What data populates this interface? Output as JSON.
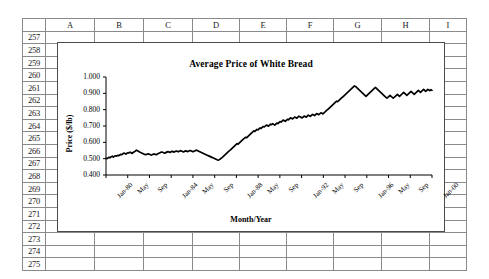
{
  "spreadsheet": {
    "columns": [
      "A",
      "B",
      "C",
      "D",
      "E",
      "F",
      "G",
      "H",
      "I"
    ],
    "rows": [
      "257",
      "258",
      "259",
      "260",
      "261",
      "262",
      "263",
      "264",
      "265",
      "266",
      "267",
      "268",
      "269",
      "270",
      "271",
      "272",
      "273",
      "274",
      "275"
    ],
    "cells": []
  },
  "chart_data": {
    "type": "line",
    "title": "Average Price of White Bread",
    "xlabel": "Month/Year",
    "ylabel": "Price ($/lb)",
    "ylim": [
      0.4,
      1.0
    ],
    "yticks": [
      "0.400",
      "0.500",
      "0.600",
      "0.700",
      "0.800",
      "0.900",
      "1.000"
    ],
    "ytick_values": [
      0.4,
      0.5,
      0.6,
      0.7,
      0.8,
      0.9,
      1.0
    ],
    "xticks": [
      "Jan-80",
      "May",
      "Sep",
      "Jan-84",
      "May",
      "Sep",
      "Jan-88",
      "May",
      "Sep",
      "Jan-92",
      "May",
      "Sep",
      "Jan-96",
      "May",
      "Sep",
      "Jan-00"
    ],
    "grid": false,
    "legend": "none",
    "series_color": "#000000",
    "series": [
      {
        "name": "Average Price of White Bread",
        "values": [
          0.502,
          0.5,
          0.505,
          0.508,
          0.506,
          0.512,
          0.515,
          0.51,
          0.514,
          0.518,
          0.516,
          0.52,
          0.518,
          0.522,
          0.526,
          0.524,
          0.53,
          0.534,
          0.531,
          0.528,
          0.533,
          0.537,
          0.535,
          0.54,
          0.536,
          0.532,
          0.538,
          0.542,
          0.546,
          0.552,
          0.549,
          0.545,
          0.541,
          0.538,
          0.535,
          0.532,
          0.529,
          0.526,
          0.524,
          0.527,
          0.53,
          0.528,
          0.525,
          0.522,
          0.524,
          0.527,
          0.529,
          0.526,
          0.524,
          0.528,
          0.532,
          0.535,
          0.538,
          0.541,
          0.539,
          0.536,
          0.534,
          0.537,
          0.54,
          0.543,
          0.541,
          0.538,
          0.542,
          0.545,
          0.543,
          0.54,
          0.544,
          0.547,
          0.545,
          0.542,
          0.546,
          0.549,
          0.547,
          0.544,
          0.541,
          0.545,
          0.548,
          0.546,
          0.543,
          0.547,
          0.55,
          0.548,
          0.545,
          0.542,
          0.546,
          0.549,
          0.552,
          0.55,
          0.547,
          0.544,
          0.541,
          0.538,
          0.535,
          0.532,
          0.529,
          0.526,
          0.523,
          0.52,
          0.517,
          0.514,
          0.511,
          0.508,
          0.505,
          0.502,
          0.499,
          0.496,
          0.493,
          0.491,
          0.494,
          0.498,
          0.503,
          0.508,
          0.514,
          0.52,
          0.526,
          0.532,
          0.538,
          0.544,
          0.55,
          0.556,
          0.562,
          0.568,
          0.574,
          0.58,
          0.586,
          0.592,
          0.589,
          0.595,
          0.601,
          0.607,
          0.613,
          0.619,
          0.625,
          0.631,
          0.628,
          0.634,
          0.64,
          0.646,
          0.652,
          0.658,
          0.664,
          0.67,
          0.667,
          0.673,
          0.679,
          0.676,
          0.682,
          0.688,
          0.685,
          0.691,
          0.697,
          0.694,
          0.7,
          0.706,
          0.703,
          0.699,
          0.705,
          0.711,
          0.708,
          0.714,
          0.71,
          0.706,
          0.712,
          0.718,
          0.715,
          0.721,
          0.727,
          0.724,
          0.73,
          0.736,
          0.733,
          0.729,
          0.735,
          0.741,
          0.738,
          0.744,
          0.75,
          0.747,
          0.743,
          0.749,
          0.755,
          0.752,
          0.748,
          0.754,
          0.76,
          0.757,
          0.753,
          0.749,
          0.755,
          0.761,
          0.758,
          0.754,
          0.76,
          0.766,
          0.763,
          0.759,
          0.765,
          0.771,
          0.768,
          0.764,
          0.77,
          0.776,
          0.773,
          0.769,
          0.775,
          0.781,
          0.778,
          0.774,
          0.78,
          0.786,
          0.792,
          0.798,
          0.804,
          0.81,
          0.816,
          0.822,
          0.828,
          0.834,
          0.84,
          0.846,
          0.852,
          0.849,
          0.855,
          0.861,
          0.867,
          0.873,
          0.879,
          0.885,
          0.891,
          0.897,
          0.903,
          0.909,
          0.915,
          0.921,
          0.927,
          0.933,
          0.939,
          0.945,
          0.942,
          0.936,
          0.93,
          0.924,
          0.918,
          0.912,
          0.906,
          0.9,
          0.894,
          0.888,
          0.882,
          0.888,
          0.894,
          0.9,
          0.906,
          0.912,
          0.918,
          0.924,
          0.93,
          0.936,
          0.93,
          0.924,
          0.918,
          0.912,
          0.906,
          0.9,
          0.894,
          0.888,
          0.882,
          0.876,
          0.87,
          0.876,
          0.882,
          0.888,
          0.882,
          0.876,
          0.87,
          0.876,
          0.882,
          0.888,
          0.894,
          0.888,
          0.882,
          0.888,
          0.894,
          0.9,
          0.906,
          0.9,
          0.894,
          0.888,
          0.894,
          0.9,
          0.906,
          0.912,
          0.906,
          0.9,
          0.894,
          0.9,
          0.906,
          0.912,
          0.918,
          0.912,
          0.906,
          0.912,
          0.918,
          0.924,
          0.918,
          0.912,
          0.918,
          0.924,
          0.92,
          0.916,
          0.922,
          0.918
        ]
      }
    ]
  }
}
